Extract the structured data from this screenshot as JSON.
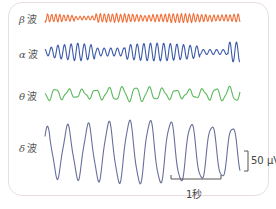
{
  "waves": [
    {
      "id": "beta",
      "greek": "β",
      "suffix": "波",
      "color": "#f0703a"
    },
    {
      "id": "alpha",
      "greek": "α",
      "suffix": "波",
      "color": "#3b5aa8"
    },
    {
      "id": "theta",
      "greek": "θ",
      "suffix": "波",
      "color": "#5cb85c"
    },
    {
      "id": "delta",
      "greek": "δ",
      "suffix": "波",
      "color": "#6a6f9a"
    }
  ],
  "scale": {
    "amplitude_label": "50 μV",
    "time_label": "1秒",
    "color": "#555555"
  },
  "frame_color": "#eadde2"
}
